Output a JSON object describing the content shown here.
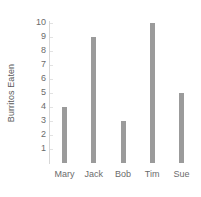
{
  "chart_data": {
    "type": "bar",
    "title": "",
    "xlabel": "",
    "ylabel": "Burritos Eaten",
    "categories": [
      "Mary",
      "Jack",
      "Bob",
      "Tim",
      "Sue"
    ],
    "values": [
      4,
      9,
      3,
      10,
      5
    ],
    "ylim": [
      0,
      10
    ],
    "yticks": [
      1,
      2,
      3,
      4,
      5,
      6,
      7,
      8,
      9,
      10
    ],
    "ytick_labels": [
      "1",
      "2",
      "3",
      "4",
      "5",
      "6",
      "7",
      "8",
      "9",
      "10"
    ],
    "grid": false,
    "legend": null,
    "bar_color": "#9b9b9b",
    "axis_color": "#d7d7d7",
    "text_color": "#6b6b6b"
  }
}
